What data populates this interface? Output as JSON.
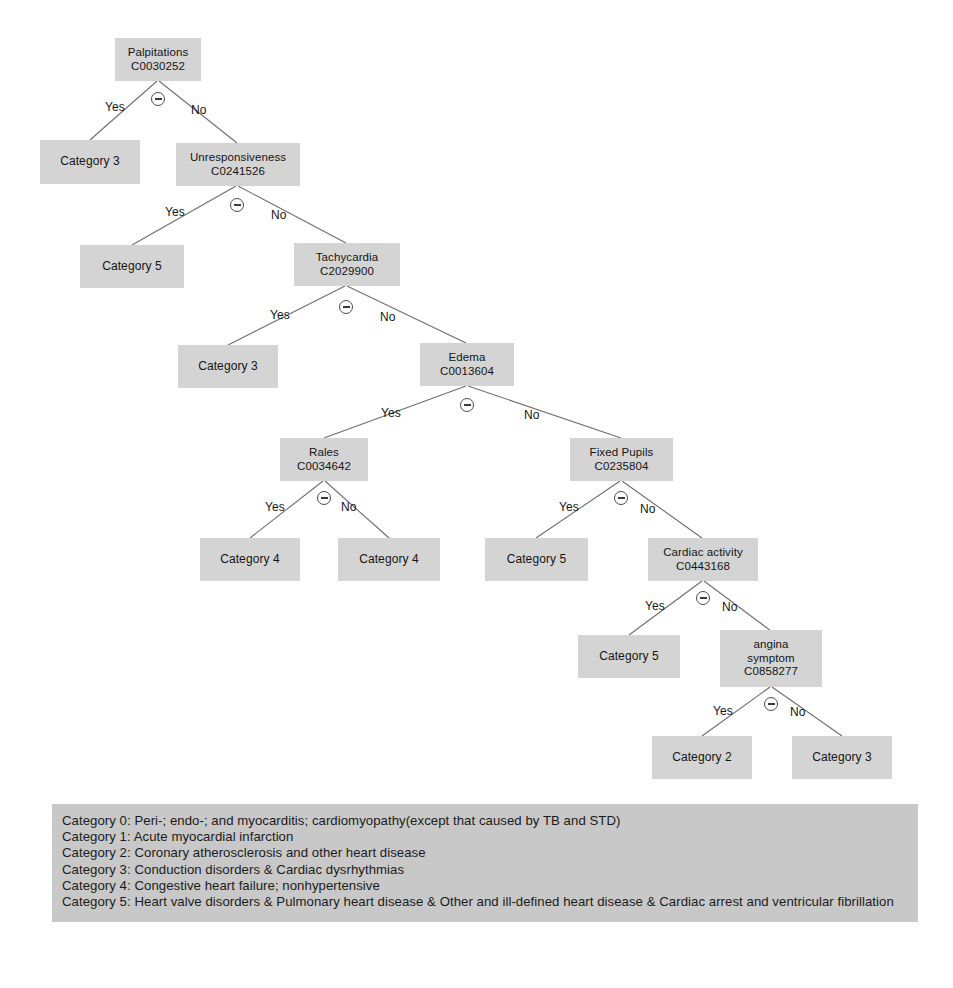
{
  "diagram": {
    "node_fill": "#d4d4d4",
    "legend_fill": "#c8c8c8",
    "edge_color": "#6e6e6e",
    "collapse_icon": "minus-circle-icon",
    "branch_labels": {
      "yes": "Yes",
      "no": "No"
    }
  },
  "nodes": {
    "palpitations": {
      "name": "Palpitations",
      "code": "C0030252"
    },
    "category3_a": {
      "label": "Category 3"
    },
    "unresponsiveness": {
      "name": "Unresponsiveness",
      "code": "C0241526"
    },
    "category5_a": {
      "label": "Category 5"
    },
    "tachycardia": {
      "name": "Tachycardia",
      "code": "C2029900"
    },
    "category3_b": {
      "label": "Category 3"
    },
    "edema": {
      "name": "Edema",
      "code": "C0013604"
    },
    "rales": {
      "name": "Rales",
      "code": "C0034642"
    },
    "fixed_pupils": {
      "name": "Fixed Pupils",
      "code": "C0235804"
    },
    "category4_a": {
      "label": "Category 4"
    },
    "category4_b": {
      "label": "Category 4"
    },
    "category5_b": {
      "label": "Category 5"
    },
    "cardiac_activity": {
      "name": "Cardiac activity",
      "code": "C0443168"
    },
    "category5_c": {
      "label": "Category 5"
    },
    "angina": {
      "name_line1": "angina",
      "name_line2": "symptom",
      "code": "C0858277"
    },
    "category2": {
      "label": "Category 2"
    },
    "category3_c": {
      "label": "Category 3"
    }
  },
  "branches": {
    "b1_yes": "Yes",
    "b1_no": "No",
    "b2_yes": "Yes",
    "b2_no": "No",
    "b3_yes": "Yes",
    "b3_no": "No",
    "b4_yes": "Yes",
    "b4_no": "No",
    "b5_yes": "Yes",
    "b5_no": "No",
    "b6_yes": "Yes",
    "b6_no": "No",
    "b7_yes": "Yes",
    "b7_no": "No",
    "b8_yes": "Yes",
    "b8_no": "No"
  },
  "legend": {
    "lines": [
      "Category 0: Peri-; endo-; and myocarditis; cardiomyopathy(except that caused by TB and STD)",
      "Category 1: Acute myocardial infarction",
      "Category 2: Coronary atherosclerosis and other heart disease",
      "Category 3: Conduction disorders & Cardiac dysrhythmias",
      "Category 4: Congestive heart failure; nonhypertensive",
      "Category 5: Heart valve disorders & Pulmonary heart disease & Other and ill-defined heart disease & Cardiac arrest and ventricular fibrillation"
    ]
  }
}
